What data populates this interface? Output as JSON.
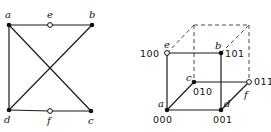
{
  "left_graph": {
    "vertices": [
      {
        "id": "a",
        "label": "a",
        "x": 9,
        "y": 25,
        "style": "solid",
        "lx": 5,
        "ly": 18
      },
      {
        "id": "e",
        "label": "e",
        "x": 50,
        "y": 25,
        "style": "hollow",
        "lx": 47,
        "ly": 18
      },
      {
        "id": "b",
        "label": "b",
        "x": 92,
        "y": 25,
        "style": "solid",
        "lx": 89,
        "ly": 18
      },
      {
        "id": "d",
        "label": "d",
        "x": 9,
        "y": 110,
        "style": "solid",
        "lx": 4,
        "ly": 123
      },
      {
        "id": "f",
        "label": "f",
        "x": 50,
        "y": 111,
        "style": "hollow",
        "lx": 47,
        "ly": 124
      },
      {
        "id": "c",
        "label": "c",
        "x": 91,
        "y": 111,
        "style": "solid",
        "lx": 88,
        "ly": 124
      }
    ],
    "edges": [
      [
        "a",
        "e"
      ],
      [
        "e",
        "b"
      ],
      [
        "a",
        "d"
      ],
      [
        "a",
        "c"
      ],
      [
        "b",
        "d"
      ],
      [
        "d",
        "f"
      ],
      [
        "f",
        "c"
      ]
    ]
  },
  "right_cube": {
    "vertices": [
      {
        "id": "a",
        "label": "a",
        "bits": "000",
        "x": 167,
        "y": 110,
        "style": "solid",
        "lx": 158,
        "ly": 107,
        "bx": 153,
        "by": 123
      },
      {
        "id": "d",
        "label": "d",
        "bits": "001",
        "x": 221,
        "y": 110,
        "style": "solid",
        "lx": 224,
        "ly": 107,
        "bx": 213,
        "by": 123
      },
      {
        "id": "c",
        "label": "c",
        "bits": "010",
        "x": 194,
        "y": 82,
        "style": "solid",
        "lx": 186,
        "ly": 81,
        "bx": 193,
        "by": 95
      },
      {
        "id": "f",
        "label": "f",
        "bits": "011",
        "x": 249,
        "y": 82,
        "style": "hollow",
        "lx": 244,
        "ly": 98,
        "bx": 254,
        "by": 85
      },
      {
        "id": "e",
        "label": "e",
        "bits": "100",
        "x": 167,
        "y": 53,
        "style": "hollow",
        "lx": 164,
        "ly": 48,
        "bx": 140,
        "by": 57
      },
      {
        "id": "b",
        "label": "b",
        "bits": "101",
        "x": 221,
        "y": 53,
        "style": "solid",
        "lx": 215,
        "ly": 49,
        "bx": 225,
        "by": 57
      },
      {
        "id": "g",
        "label": "",
        "bits": "",
        "x": 194,
        "y": 25,
        "style": "none"
      },
      {
        "id": "h",
        "label": "",
        "bits": "",
        "x": 249,
        "y": 25,
        "style": "none"
      }
    ],
    "solid_edges": [
      [
        "a",
        "d"
      ],
      [
        "a",
        "e"
      ],
      [
        "e",
        "b"
      ],
      [
        "b",
        "d"
      ],
      [
        "a",
        "c"
      ],
      [
        "c",
        "f"
      ],
      [
        "d",
        "f"
      ]
    ],
    "dashed_edges": [
      [
        "e",
        "g"
      ],
      [
        "g",
        "h"
      ],
      [
        "b",
        "h"
      ],
      [
        "g",
        "c"
      ],
      [
        "h",
        "f"
      ]
    ]
  }
}
